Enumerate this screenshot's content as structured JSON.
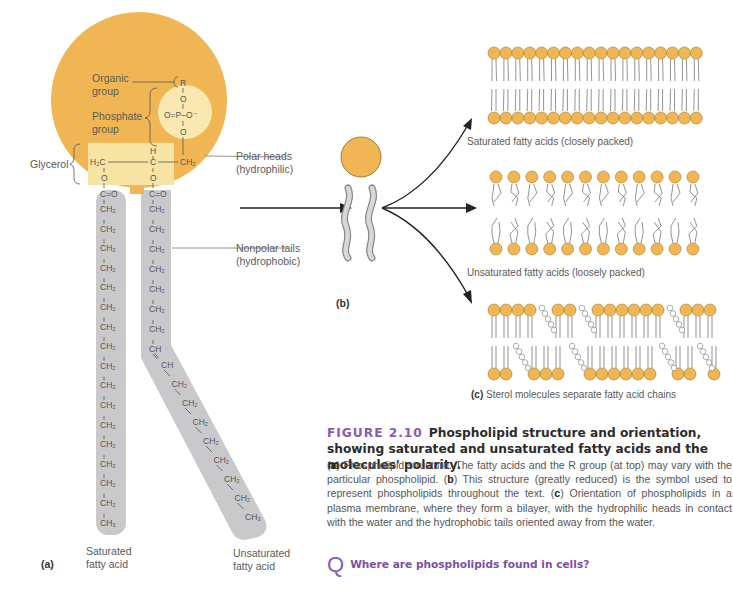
{
  "figure": {
    "number": "FIGURE 2.10",
    "title": "Phospholipid structure and orientation, showing saturated and unsaturated fatty acids and the molecules' polarity.",
    "caption_parts": [
      {
        "tag": "a",
        "text": " Phospholipid structure. The fatty acids and the R group (at top) may vary with the particular phospholipid. "
      },
      {
        "tag": "b",
        "text": " This structure (greatly reduced) is the symbol used to represent phospholipids throughout the text. "
      },
      {
        "tag": "c",
        "text": " Orientation of phospholipids in a plasma membrane, where they form a bilayer, with the hydrophilic heads in contact with the water and the hydrophobic tails oriented away from the water."
      }
    ],
    "question": "Where are phospholipids found in cells?",
    "question_icon": "Q"
  },
  "panel_a": {
    "label": "(a)",
    "labels": {
      "organic_group": [
        "Organic",
        "group"
      ],
      "phosphate_group": [
        "Phosphate",
        "group"
      ],
      "glycerol": "Glycerol",
      "polar_heads": [
        "Polar heads",
        "(hydrophilic)"
      ],
      "nonpolar_tails": [
        "Nonpolar tails",
        "(hydrophobic)"
      ],
      "saturated": [
        "Saturated",
        "fatty acid"
      ],
      "unsaturated": [
        "Unsaturated",
        "fatty acid"
      ]
    },
    "chem": {
      "R": "R",
      "O": "O",
      "P": "P",
      "O_minus": "O⁻",
      "H2C": "H₂C",
      "H": "H",
      "C": "C",
      "CH2": "CH₂",
      "CH": "CH",
      "CH3": "CH₃",
      "CO": "C=O"
    },
    "saturated_chain_ch2_count": 16,
    "unsaturated_chain": {
      "ch2_before_double_bond": 7,
      "ch2_after_double_bond": 7
    }
  },
  "panel_b": {
    "label": "(b)"
  },
  "panel_c": {
    "saturated_caption": "Saturated fatty acids (closely packed)",
    "unsaturated_caption": "Unsaturated fatty acids (loosely packed)",
    "sterol_label": "(c)",
    "sterol_caption": "Sterol molecules separate fatty acid chains"
  },
  "colors": {
    "head_orange": "#f0b654",
    "head_light": "#f9e9b0",
    "glycerol_box": "#f7e3a4",
    "tail_gray": "#c9c9cc",
    "ink": "#555555",
    "accent_purple": "#8a5ab0"
  }
}
